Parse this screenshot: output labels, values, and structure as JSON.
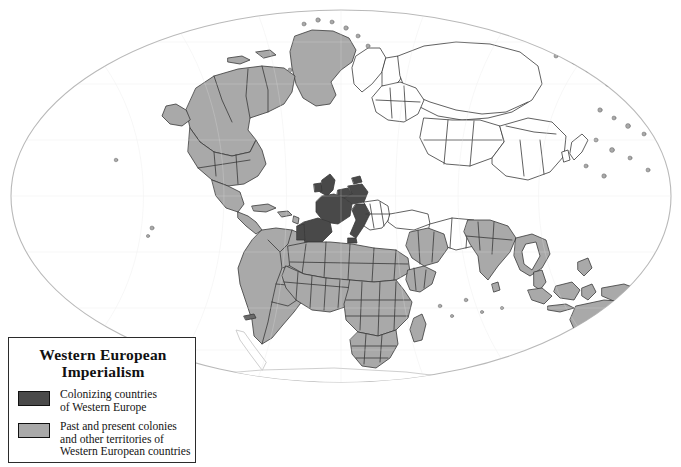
{
  "map": {
    "projection": "elliptical-world",
    "background_color": "#ffffff",
    "ellipse_border_color": "#b9b9b9",
    "country_border_color": "#3a3a3a",
    "colors": {
      "colonizer_fill": "#4a4a4a",
      "colony_fill": "#a9a9a9",
      "uncolonized_fill": "#ffffff",
      "antarctica_fill": "#ffffff",
      "antarctica_border": "#c9c9c9"
    },
    "colonizer_regions": [
      "United Kingdom",
      "Ireland",
      "France",
      "Spain",
      "Portugal",
      "Belgium",
      "Netherlands",
      "Germany",
      "Italy",
      "Denmark"
    ],
    "colony_regions": [
      "Greenland",
      "Canada",
      "United States",
      "Alaska",
      "Mexico",
      "Central America",
      "Caribbean",
      "Brazil",
      "Argentina",
      "Chile",
      "Peru",
      "Colombia",
      "Venezuela",
      "Bolivia",
      "Paraguay",
      "Uruguay",
      "Ecuador",
      "Guyanas",
      "North Africa",
      "West Africa",
      "Central Africa",
      "East Africa",
      "Southern Africa",
      "Madagascar",
      "Arabian Peninsula",
      "Iraq",
      "Syria",
      "India",
      "Pakistan",
      "Bangladesh",
      "Sri Lanka",
      "Myanmar",
      "Indochina",
      "Malaysia",
      "Indonesia",
      "Philippines",
      "Papua New Guinea",
      "Australia",
      "New Zealand",
      "Pacific Islands"
    ],
    "uncolonized_regions": [
      "Russia",
      "China",
      "Mongolia",
      "Central Asia",
      "Scandinavia",
      "Finland",
      "Poland",
      "Eastern Europe",
      "Turkey",
      "Iran",
      "Afghanistan",
      "Japan",
      "Korea",
      "Thailand",
      "Ethiopia"
    ]
  },
  "legend": {
    "title_line_1": "Western European",
    "title_line_2": "Imperialism",
    "entries": [
      {
        "swatch": "dark-gray-swatch",
        "color": "#4a4a4a",
        "line_1": "Colonizing countries",
        "line_2": "of Western Europe",
        "line_3": ""
      },
      {
        "swatch": "light-gray-swatch",
        "color": "#a9a9a9",
        "line_1": "Past and present colonies",
        "line_2": "and other territories of",
        "line_3": "Western European countries"
      }
    ]
  }
}
